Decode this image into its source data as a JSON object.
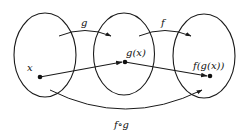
{
  "diagram": {
    "type": "function-composition",
    "sets": [
      {
        "id": "domain-g",
        "element_label": "x"
      },
      {
        "id": "codomain-g",
        "element_label": "g(x)"
      },
      {
        "id": "codomain-f",
        "element_label": "f(g(x))"
      }
    ],
    "maps": [
      {
        "label": "g",
        "from": "domain-g",
        "to": "codomain-g"
      },
      {
        "label": "f",
        "from": "codomain-g",
        "to": "codomain-f"
      },
      {
        "label": "f∘g",
        "from": "domain-g",
        "to": "codomain-f"
      }
    ],
    "labels": {
      "x": "x",
      "gx": "g(x)",
      "fgx": "f(g(x))",
      "g": "g",
      "f": "f",
      "fog": "f∘g"
    },
    "colors": {
      "stroke": "#1a1a1a",
      "background": "#ffffff"
    }
  }
}
